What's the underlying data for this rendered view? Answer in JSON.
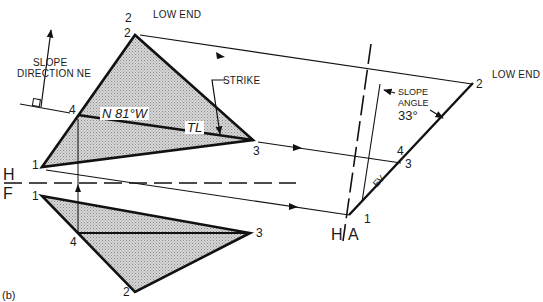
{
  "figure_label": "(b)",
  "top_view": {
    "points": {
      "p1": "1",
      "p2_outer": "2",
      "p2": "2",
      "p3": "3",
      "p4": "4"
    },
    "low_end_label": "LOW END",
    "slope_direction_label_1": "SLOPE",
    "slope_direction_label_2": "DIRECTION NE",
    "bearing_label": "N 81°W",
    "tl_label": "TL",
    "strike_label": "STRIKE"
  },
  "front_view": {
    "points": {
      "p1": "1",
      "p2": "2",
      "p3": "3",
      "p4": "4"
    }
  },
  "fold_lines": {
    "hf_top": "H",
    "hf_bottom": "F",
    "ha_left": "H",
    "ha_right": "A"
  },
  "auxiliary_view": {
    "points": {
      "p1": "1",
      "p2": "2",
      "p3": "3",
      "p4": "4"
    },
    "low_end_label": "LOW END",
    "ev_label": "EV",
    "slope_angle_label_1": "SLOPE",
    "slope_angle_label_2": "ANGLE",
    "slope_angle_value": "33°"
  },
  "colors": {
    "line": "#111111",
    "fill_shade": "#bdbdbd"
  }
}
